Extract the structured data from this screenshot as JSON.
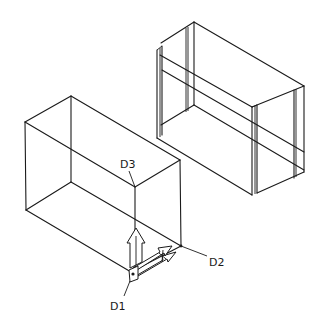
{
  "diagram": {
    "type": "isometric wireframe drawing",
    "colors": {
      "line": "#1a1a1a",
      "background": "#ffffff"
    },
    "objects": [
      {
        "name": "left-box",
        "description": "plain rectangular wireframe box"
      },
      {
        "name": "right-box",
        "description": "rectangular duct section with flanged end frames"
      }
    ],
    "labels": [
      {
        "id": "D1",
        "text": "D1"
      },
      {
        "id": "D2",
        "text": "D2"
      },
      {
        "id": "D3",
        "text": "D3"
      }
    ],
    "ucs_icon": {
      "description": "3D direction arrows at corner D1"
    }
  }
}
